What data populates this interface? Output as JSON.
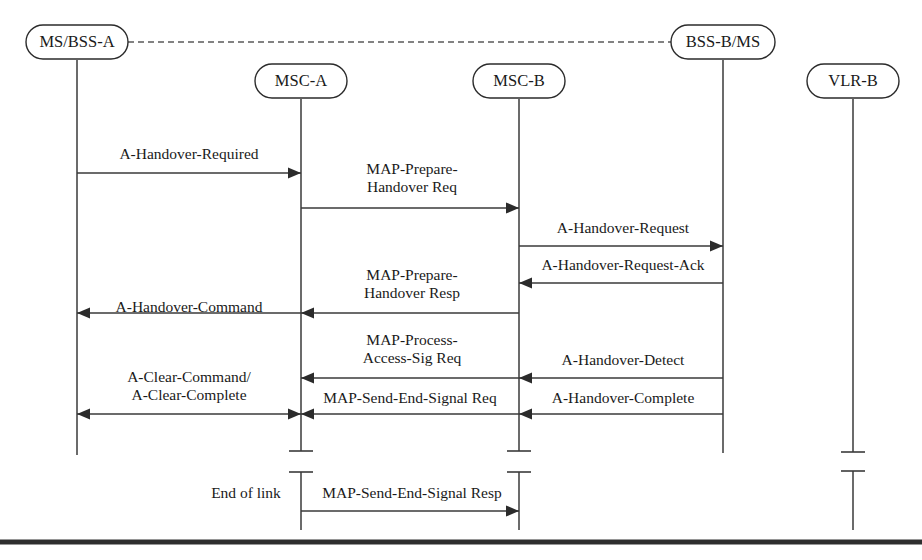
{
  "diagram": {
    "type": "sequence-diagram",
    "ink_color": "#2b2b2b",
    "background_color": "#ffffff",
    "lifelines": [
      {
        "id": "ms_bss_a",
        "label": "MS/BSS-A",
        "x": 77,
        "box_y": 42,
        "box_w": 102,
        "box_h": 34,
        "line_top": 60,
        "line_bottom": 455,
        "break": false
      },
      {
        "id": "msc_a",
        "label": "MSC-A",
        "x": 301,
        "box_y": 81,
        "box_w": 92,
        "box_h": 34,
        "line_top": 99,
        "line_bottom": 530,
        "break": true
      },
      {
        "id": "msc_b",
        "label": "MSC-B",
        "x": 519,
        "box_y": 81,
        "box_w": 92,
        "box_h": 34,
        "line_top": 99,
        "line_bottom": 530,
        "break": true
      },
      {
        "id": "bss_b_ms",
        "label": "BSS-B/MS",
        "x": 723,
        "box_y": 42,
        "box_w": 104,
        "box_h": 34,
        "line_top": 60,
        "line_bottom": 453,
        "break": false
      },
      {
        "id": "vlr_b",
        "label": "VLR-B",
        "x": 853,
        "box_y": 81,
        "box_w": 92,
        "box_h": 34,
        "line_top": 99,
        "line_bottom": 530,
        "break": true
      }
    ],
    "air_link": {
      "name": "air-interface-dashed-link",
      "from": "ms_bss_a",
      "to": "bss_b_ms",
      "y": 42,
      "style": "dashed"
    },
    "messages": [
      {
        "id": "m1",
        "label": "A-Handover-Required",
        "from_x": 77,
        "to_x": 301,
        "y": 173,
        "direction": "right",
        "label_lines": [
          "A-Handover-Required"
        ],
        "label_x": 189,
        "label_y": 155,
        "label_anchor": "center"
      },
      {
        "id": "m2",
        "label": "MAP-Prepare-Handover Req",
        "from_x": 301,
        "to_x": 519,
        "y": 208,
        "direction": "right",
        "label_lines": [
          "MAP-Prepare-",
          "Handover Req"
        ],
        "label_x": 412,
        "label_y": 170,
        "label_anchor": "center"
      },
      {
        "id": "m3",
        "label": "A-Handover-Request",
        "from_x": 519,
        "to_x": 723,
        "y": 246,
        "direction": "right",
        "label_lines": [
          "A-Handover-Request"
        ],
        "label_x": 623,
        "label_y": 229,
        "label_anchor": "center"
      },
      {
        "id": "m4",
        "label": "A-Handover-Request-Ack",
        "from_x": 723,
        "to_x": 519,
        "y": 283,
        "direction": "left",
        "label_lines": [
          "A-Handover-Request-Ack"
        ],
        "label_x": 623,
        "label_y": 266,
        "label_anchor": "center"
      },
      {
        "id": "m5",
        "label": "MAP-Prepare-Handover Resp",
        "from_x": 519,
        "to_x": 301,
        "y": 313,
        "direction": "left",
        "label_lines": [
          "MAP-Prepare-",
          "Handover Resp"
        ],
        "label_x": 412,
        "label_y": 276,
        "label_anchor": "center"
      },
      {
        "id": "m6",
        "label": "A-Handover-Command",
        "from_x": 301,
        "to_x": 77,
        "y": 313,
        "direction": "left",
        "label_lines": [
          "A-Handover-Command"
        ],
        "label_x": 189,
        "label_y": 308,
        "label_anchor": "center"
      },
      {
        "id": "m7",
        "label": "MAP-Process-Access-Sig Req",
        "from_x": 519,
        "to_x": 301,
        "y": 378,
        "direction": "left",
        "label_lines": [
          "MAP-Process-",
          "Access-Sig Req"
        ],
        "label_x": 412,
        "label_y": 341,
        "label_anchor": "center"
      },
      {
        "id": "m8",
        "label": "A-Handover-Detect",
        "from_x": 723,
        "to_x": 519,
        "y": 378,
        "direction": "left",
        "label_lines": [
          "A-Handover-Detect"
        ],
        "label_x": 623,
        "label_y": 361,
        "label_anchor": "center"
      },
      {
        "id": "m9",
        "label": "A-Clear-Command/ A-Clear-Complete",
        "from_x": 301,
        "to_x": 77,
        "y": 414,
        "direction": "both",
        "label_lines": [
          "A-Clear-Command/",
          "A-Clear-Complete"
        ],
        "label_x": 189,
        "label_y": 378,
        "label_anchor": "center"
      },
      {
        "id": "m10",
        "label": "MAP-Send-End-Signal Req",
        "from_x": 519,
        "to_x": 301,
        "y": 414,
        "direction": "left",
        "label_lines": [
          "MAP-Send-End-Signal Req"
        ],
        "label_x": 410,
        "label_y": 399,
        "label_anchor": "center"
      },
      {
        "id": "m11",
        "label": "A-Handover-Complete",
        "from_x": 723,
        "to_x": 519,
        "y": 414,
        "direction": "left",
        "label_lines": [
          "A-Handover-Complete"
        ],
        "label_x": 623,
        "label_y": 399,
        "label_anchor": "center"
      },
      {
        "id": "m12",
        "label": "MAP-Send-End-Signal Resp",
        "from_x": 301,
        "to_x": 519,
        "y": 511,
        "direction": "right",
        "label_lines": [
          "MAP-Send-End-Signal Resp"
        ],
        "label_x": 412,
        "label_y": 494,
        "label_anchor": "center"
      }
    ],
    "notes": [
      {
        "id": "n1",
        "text": "End of link",
        "x": 246,
        "y": 494
      }
    ],
    "lifeline_breaks": [
      {
        "lifeline": "msc_a",
        "upper_tick_y": 451,
        "lower_tick_y": 472,
        "tick_half_width": 12
      },
      {
        "lifeline": "msc_b",
        "upper_tick_y": 451,
        "lower_tick_y": 472,
        "tick_half_width": 12
      },
      {
        "lifeline": "vlr_b",
        "upper_tick_y": 452,
        "lower_tick_y": 471,
        "tick_half_width": 12
      }
    ],
    "baseline_rule": {
      "y": 542,
      "x1": 0,
      "x2": 922
    }
  }
}
